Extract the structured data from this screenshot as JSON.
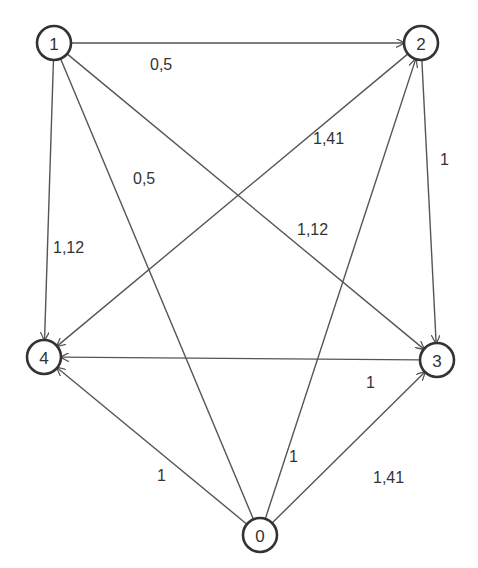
{
  "diagram": {
    "type": "directed-weighted-graph",
    "nodes": [
      {
        "id": "1",
        "label": "1",
        "x": 54,
        "y": 43
      },
      {
        "id": "2",
        "label": "2",
        "x": 421,
        "y": 43
      },
      {
        "id": "3",
        "label": "3",
        "x": 437,
        "y": 360
      },
      {
        "id": "4",
        "label": "4",
        "x": 44,
        "y": 357
      },
      {
        "id": "0",
        "label": "0",
        "x": 260,
        "y": 535
      }
    ],
    "edges": [
      {
        "from": "1",
        "to": "2",
        "weight": "0,5",
        "directed": true,
        "label_x": 150,
        "label_y": 70
      },
      {
        "from": "1",
        "to": "0",
        "weight": "0,5",
        "directed": false,
        "label_x": 133,
        "label_y": 184
      },
      {
        "from": "1",
        "to": "3",
        "weight": "1,12",
        "directed": true,
        "label_x": 297,
        "label_y": 235
      },
      {
        "from": "1",
        "to": "4",
        "weight": "1,12",
        "directed": true,
        "label_x": 53,
        "label_y": 253
      },
      {
        "from": "2",
        "to": "4",
        "weight": "1,41",
        "directed": true,
        "label_x": 313,
        "label_y": 144
      },
      {
        "from": "2",
        "to": "3",
        "weight": "1",
        "directed": true,
        "label_x": 440,
        "label_y": 165
      },
      {
        "from": "3",
        "to": "4",
        "weight": "1",
        "directed": true,
        "label_x": 366,
        "label_y": 388
      },
      {
        "from": "0",
        "to": "4",
        "weight": "1",
        "directed": true,
        "label_x": 157,
        "label_y": 481
      },
      {
        "from": "0",
        "to": "2",
        "weight": "1",
        "directed": true,
        "label_x": 289,
        "label_y": 462
      },
      {
        "from": "0",
        "to": "3",
        "weight": "1,41",
        "directed": true,
        "label_x": 373,
        "label_y": 483
      }
    ],
    "colors": {
      "edge": "#555555",
      "node_stroke": "#333333",
      "text": "#333333",
      "background": "#ffffff"
    }
  }
}
